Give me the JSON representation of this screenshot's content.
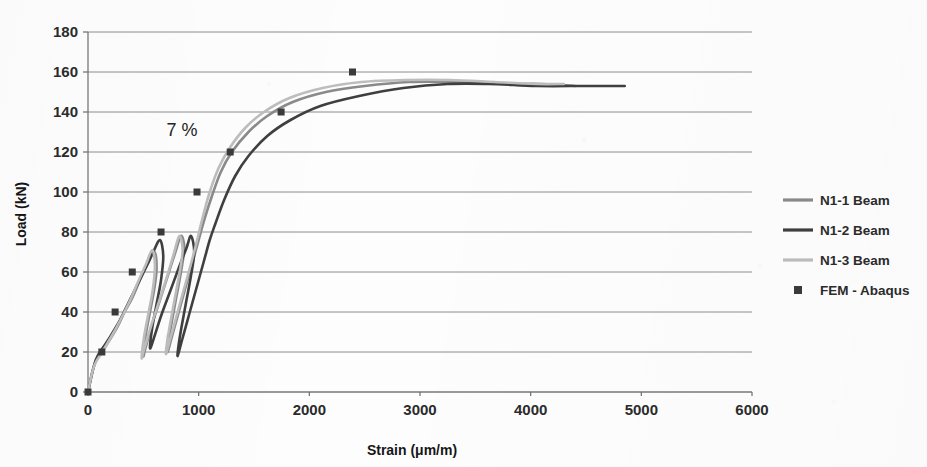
{
  "chart_data": {
    "type": "line",
    "title": "",
    "xlabel": "Strain (μm/m)",
    "ylabel": "Load (kN)",
    "xlim": [
      0,
      6000
    ],
    "ylim": [
      0,
      180
    ],
    "xticks": [
      "0",
      "1000",
      "2000",
      "3000",
      "4000",
      "5000",
      "6000"
    ],
    "xtick_values": [
      0,
      1000,
      2000,
      3000,
      4000,
      5000,
      6000
    ],
    "yticks": [
      "0",
      "20",
      "40",
      "60",
      "80",
      "100",
      "120",
      "140",
      "160",
      "180"
    ],
    "ytick_values": [
      0,
      20,
      40,
      60,
      80,
      100,
      120,
      140,
      160,
      180
    ],
    "grid": "horizontal",
    "legend_position": "right",
    "annotations": [
      {
        "text": "7 %",
        "x": 850,
        "y": 128
      }
    ],
    "series": [
      {
        "name": "N1-1 Beam",
        "style": "line",
        "color": "#8a8a8a",
        "width": 2.6,
        "points": [
          [
            0,
            0
          ],
          [
            60,
            14
          ],
          [
            150,
            22
          ],
          [
            260,
            32
          ],
          [
            330,
            40
          ],
          [
            400,
            47
          ],
          [
            470,
            56
          ],
          [
            540,
            64
          ],
          [
            600,
            70
          ],
          [
            620,
            62
          ],
          [
            600,
            52
          ],
          [
            560,
            40
          ],
          [
            520,
            28
          ],
          [
            500,
            18
          ],
          [
            520,
            22
          ],
          [
            580,
            34
          ],
          [
            650,
            46
          ],
          [
            720,
            58
          ],
          [
            790,
            70
          ],
          [
            840,
            78
          ],
          [
            870,
            72
          ],
          [
            840,
            60
          ],
          [
            800,
            48
          ],
          [
            760,
            36
          ],
          [
            730,
            26
          ],
          [
            720,
            20
          ],
          [
            760,
            28
          ],
          [
            830,
            42
          ],
          [
            900,
            56
          ],
          [
            960,
            68
          ],
          [
            1010,
            78
          ],
          [
            1050,
            86
          ],
          [
            1120,
            98
          ],
          [
            1200,
            110
          ],
          [
            1300,
            120
          ],
          [
            1450,
            130
          ],
          [
            1620,
            138
          ],
          [
            1850,
            145
          ],
          [
            2150,
            150
          ],
          [
            2500,
            153
          ],
          [
            2900,
            155
          ],
          [
            3300,
            155
          ],
          [
            3700,
            154
          ],
          [
            4100,
            154
          ],
          [
            4400,
            153
          ]
        ]
      },
      {
        "name": "N1-2 Beam",
        "style": "line",
        "color": "#3f3f3f",
        "width": 2.6,
        "points": [
          [
            0,
            0
          ],
          [
            70,
            16
          ],
          [
            170,
            25
          ],
          [
            280,
            35
          ],
          [
            360,
            44
          ],
          [
            440,
            53
          ],
          [
            520,
            62
          ],
          [
            590,
            70
          ],
          [
            650,
            76
          ],
          [
            680,
            68
          ],
          [
            660,
            56
          ],
          [
            620,
            44
          ],
          [
            580,
            32
          ],
          [
            560,
            22
          ],
          [
            590,
            26
          ],
          [
            660,
            38
          ],
          [
            740,
            50
          ],
          [
            820,
            62
          ],
          [
            890,
            72
          ],
          [
            930,
            78
          ],
          [
            960,
            70
          ],
          [
            930,
            58
          ],
          [
            890,
            46
          ],
          [
            850,
            34
          ],
          [
            820,
            24
          ],
          [
            810,
            18
          ],
          [
            850,
            26
          ],
          [
            920,
            40
          ],
          [
            990,
            54
          ],
          [
            1050,
            66
          ],
          [
            1100,
            76
          ],
          [
            1150,
            84
          ],
          [
            1230,
            96
          ],
          [
            1330,
            108
          ],
          [
            1450,
            118
          ],
          [
            1620,
            128
          ],
          [
            1830,
            136
          ],
          [
            2100,
            143
          ],
          [
            2450,
            148
          ],
          [
            2850,
            152
          ],
          [
            3250,
            154
          ],
          [
            3650,
            154
          ],
          [
            4050,
            153
          ],
          [
            4500,
            153
          ],
          [
            4850,
            153
          ]
        ]
      },
      {
        "name": "N1-3 Beam",
        "style": "line",
        "color": "#bdbdbd",
        "width": 2.6,
        "points": [
          [
            0,
            0
          ],
          [
            55,
            13
          ],
          [
            140,
            21
          ],
          [
            245,
            31
          ],
          [
            320,
            39
          ],
          [
            390,
            47
          ],
          [
            460,
            56
          ],
          [
            525,
            64
          ],
          [
            580,
            71
          ],
          [
            605,
            63
          ],
          [
            585,
            51
          ],
          [
            545,
            39
          ],
          [
            505,
            27
          ],
          [
            485,
            17
          ],
          [
            505,
            21
          ],
          [
            570,
            33
          ],
          [
            640,
            45
          ],
          [
            710,
            57
          ],
          [
            775,
            69
          ],
          [
            825,
            78
          ],
          [
            855,
            71
          ],
          [
            825,
            59
          ],
          [
            785,
            47
          ],
          [
            745,
            35
          ],
          [
            715,
            25
          ],
          [
            705,
            19
          ],
          [
            745,
            27
          ],
          [
            815,
            41
          ],
          [
            885,
            55
          ],
          [
            945,
            67
          ],
          [
            995,
            78
          ],
          [
            1035,
            87
          ],
          [
            1100,
            100
          ],
          [
            1180,
            112
          ],
          [
            1280,
            122
          ],
          [
            1420,
            132
          ],
          [
            1590,
            140
          ],
          [
            1820,
            147
          ],
          [
            2120,
            152
          ],
          [
            2470,
            155
          ],
          [
            2870,
            156
          ],
          [
            3270,
            156
          ],
          [
            3670,
            155
          ],
          [
            4050,
            154
          ],
          [
            4300,
            154
          ]
        ]
      },
      {
        "name": "FEM - Abaqus",
        "style": "marker",
        "color": "#3a3a3a",
        "marker": "square",
        "marker_size": 7,
        "points": [
          [
            0,
            0
          ],
          [
            125,
            20
          ],
          [
            245,
            40
          ],
          [
            400,
            60
          ],
          [
            660,
            80
          ],
          [
            985,
            100
          ],
          [
            1285,
            120
          ],
          [
            1745,
            140
          ],
          [
            2390,
            160
          ]
        ]
      }
    ]
  },
  "legend": {
    "entries": [
      {
        "label": "N1-1 Beam",
        "swatch": "line",
        "color": "#8a8a8a"
      },
      {
        "label": "N1-2 Beam",
        "swatch": "line",
        "color": "#3f3f3f"
      },
      {
        "label": "N1-3 Beam",
        "swatch": "line",
        "color": "#bdbdbd"
      },
      {
        "label": "FEM - Abaqus",
        "swatch": "square",
        "color": "#3a3a3a"
      }
    ]
  }
}
